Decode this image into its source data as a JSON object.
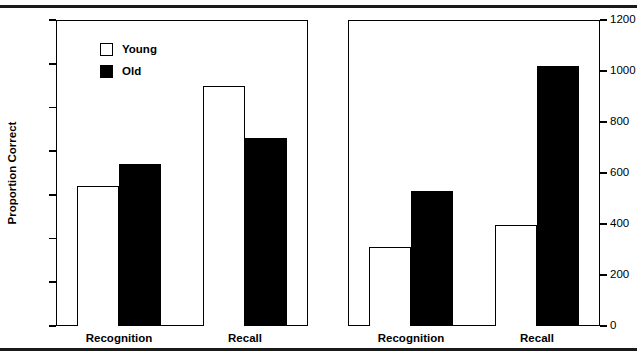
{
  "chart_data": [
    {
      "type": "bar",
      "panel": "left",
      "title": "",
      "xlabel": "",
      "ylabel": "Proportion Correct",
      "ylim": [
        30,
        100
      ],
      "yticks": [
        30,
        40,
        50,
        60,
        70,
        80,
        90,
        100
      ],
      "ytick_labels": [
        "30",
        "40",
        "50",
        "60",
        "70",
        "80",
        "90",
        "100"
      ],
      "y_axis_side": "left",
      "grid": false,
      "categories": [
        "Recognition",
        "Recall"
      ],
      "legend": [
        "Young",
        "Old"
      ],
      "legend_position": "upper left inside",
      "series": [
        {
          "name": "Young",
          "values": [
            62,
            85
          ],
          "fill": "#ffffff",
          "edge": "#000000"
        },
        {
          "name": "Old",
          "values": [
            67,
            73
          ],
          "fill": "#000000",
          "edge": "#000000"
        }
      ]
    },
    {
      "type": "bar",
      "panel": "right",
      "title": "",
      "xlabel": "",
      "ylabel": "Reaction Time",
      "ylim": [
        0,
        1200
      ],
      "yticks": [
        0,
        200,
        400,
        600,
        800,
        1000,
        1200
      ],
      "ytick_labels": [
        "0",
        "200",
        "400",
        "600",
        "800",
        "1000",
        "1200"
      ],
      "y_axis_side": "right",
      "grid": false,
      "categories": [
        "Recognition",
        "Recall"
      ],
      "legend": [],
      "series": [
        {
          "name": "Young",
          "values": [
            310,
            395
          ],
          "fill": "#ffffff",
          "edge": "#000000"
        },
        {
          "name": "Old",
          "values": [
            530,
            1020
          ],
          "fill": "#000000",
          "edge": "#000000"
        }
      ]
    }
  ],
  "colors": {
    "young": "#ffffff",
    "old": "#000000",
    "line": "#000000",
    "background": "#ffffff"
  }
}
